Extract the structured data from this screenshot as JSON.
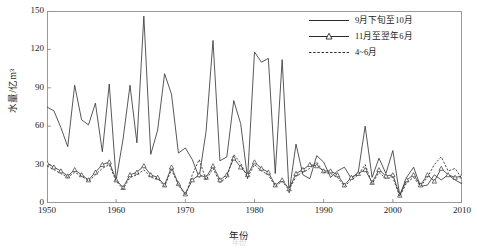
{
  "chart_data": {
    "type": "line",
    "title": "",
    "xlabel": "年份",
    "ylabel": "水量/亿m³",
    "xlim": [
      1950,
      2010
    ],
    "ylim": [
      0,
      150
    ],
    "xticks": [
      1950,
      1960,
      1970,
      1980,
      1990,
      2000,
      2010
    ],
    "yticks": [
      0,
      30,
      60,
      90,
      120,
      150
    ],
    "grid": false,
    "legend_position": "top-right",
    "x": [
      1950,
      1951,
      1952,
      1953,
      1954,
      1955,
      1956,
      1957,
      1958,
      1959,
      1960,
      1961,
      1962,
      1963,
      1964,
      1965,
      1966,
      1967,
      1968,
      1969,
      1970,
      1971,
      1972,
      1973,
      1974,
      1975,
      1976,
      1977,
      1978,
      1979,
      1980,
      1981,
      1982,
      1983,
      1984,
      1985,
      1986,
      1987,
      1988,
      1989,
      1990,
      1991,
      1992,
      1993,
      1994,
      1995,
      1996,
      1997,
      1998,
      1999,
      2000,
      2001,
      2002,
      2003,
      2004,
      2005,
      2006,
      2007,
      2008,
      2009,
      2010
    ],
    "series": [
      {
        "name": "9月下旬至10月",
        "style": "solid",
        "marker": "none",
        "color": "#3a3a3a",
        "values": [
          75,
          72,
          59,
          44,
          92,
          65,
          61,
          78,
          40,
          93,
          18,
          50,
          92,
          47,
          146,
          38,
          57,
          101,
          85,
          39,
          43,
          34,
          20,
          56,
          127,
          33,
          36,
          80,
          62,
          19,
          118,
          110,
          113,
          23,
          112,
          8,
          46,
          22,
          19,
          37,
          32,
          20,
          25,
          28,
          19,
          24,
          60,
          20,
          35,
          23,
          41,
          6,
          20,
          28,
          13,
          14,
          22,
          18,
          22,
          18,
          15
        ]
      },
      {
        "name": "11月至翌年6月",
        "style": "solid",
        "marker": "triangle",
        "color": "#3a3a3a",
        "values": [
          31,
          28,
          25,
          21,
          26,
          22,
          18,
          24,
          30,
          32,
          18,
          12,
          22,
          24,
          29,
          22,
          20,
          14,
          28,
          15,
          7,
          18,
          22,
          20,
          29,
          18,
          22,
          35,
          28,
          22,
          32,
          27,
          24,
          14,
          18,
          11,
          23,
          26,
          30,
          29,
          25,
          25,
          22,
          14,
          20,
          23,
          26,
          16,
          26,
          21,
          22,
          6,
          18,
          22,
          14,
          22,
          17,
          27,
          22,
          20,
          21
        ]
      },
      {
        "name": "4~6月",
        "style": "dashed",
        "marker": "none",
        "color": "#3a3a3a",
        "values": [
          29,
          26,
          23,
          20,
          24,
          21,
          17,
          22,
          27,
          30,
          17,
          11,
          20,
          22,
          26,
          20,
          19,
          13,
          26,
          14,
          6,
          22,
          34,
          18,
          27,
          16,
          20,
          38,
          31,
          20,
          30,
          25,
          22,
          13,
          17,
          10,
          21,
          24,
          27,
          32,
          24,
          23,
          20,
          13,
          18,
          22,
          30,
          15,
          24,
          19,
          20,
          5,
          16,
          20,
          13,
          20,
          30,
          36,
          25,
          27,
          19
        ]
      }
    ]
  },
  "legend": {
    "items": [
      {
        "label": "9月下旬至10月",
        "symbol": "solid-line"
      },
      {
        "label": "11月至翌年6月",
        "symbol": "triangle-line"
      },
      {
        "label": "4~6月",
        "symbol": "dashed-line"
      }
    ]
  },
  "axes": {
    "ylabel": "水量/亿m³",
    "xlabel": "年份",
    "yticks": [
      "0",
      "30",
      "60",
      "90",
      "120",
      "150"
    ],
    "xticks": [
      "1950",
      "1960",
      "1970",
      "1980",
      "1990",
      "2000",
      "2010"
    ]
  },
  "caption": {
    "line1": "年份",
    "line2": ""
  }
}
